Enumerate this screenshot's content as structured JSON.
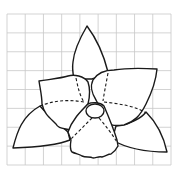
{
  "figure": {
    "grid": {
      "columns": 9,
      "rows": 8,
      "line_color": "#c8c8c8"
    },
    "stroke_color": "#1a1a1a",
    "background_color": "#ffffff",
    "parts": [
      {
        "name": "top-sepal",
        "style": "solid"
      },
      {
        "name": "left-petal",
        "style": "solid"
      },
      {
        "name": "right-petal",
        "style": "solid"
      },
      {
        "name": "left-sepal",
        "style": "solid"
      },
      {
        "name": "right-sepal",
        "style": "solid"
      },
      {
        "name": "lip",
        "style": "solid-ruffled"
      },
      {
        "name": "column",
        "style": "solid"
      },
      {
        "name": "hidden-edges",
        "style": "dashed"
      }
    ]
  }
}
